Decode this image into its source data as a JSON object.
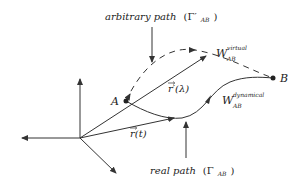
{
  "diagram": {
    "labels": {
      "arbitrary_path": "arbitrary path",
      "arbitrary_path_symbol": "(Γ′",
      "arbitrary_path_sub": "AB",
      "arbitrary_path_close": ")",
      "real_path": "real path",
      "real_path_symbol": "(Γ",
      "real_path_sub": "AB",
      "real_path_close": ")",
      "w_virtual_main": "W",
      "w_virtual_sup": "virtual",
      "w_virtual_sub": "AB",
      "w_dynamical_main": "W",
      "w_dynamical_sup": "dynamical",
      "w_dynamical_sub": "AB",
      "r_prime_lambda": "r′(λ)",
      "r_t": "r(t)",
      "point_a": "A",
      "point_b": "B"
    },
    "points": {
      "origin": [
        80,
        138
      ],
      "A": [
        126,
        101
      ],
      "B": [
        273,
        78
      ]
    },
    "colors": {
      "stroke": "#333333",
      "text": "#222222",
      "background": "#ffffff"
    }
  }
}
